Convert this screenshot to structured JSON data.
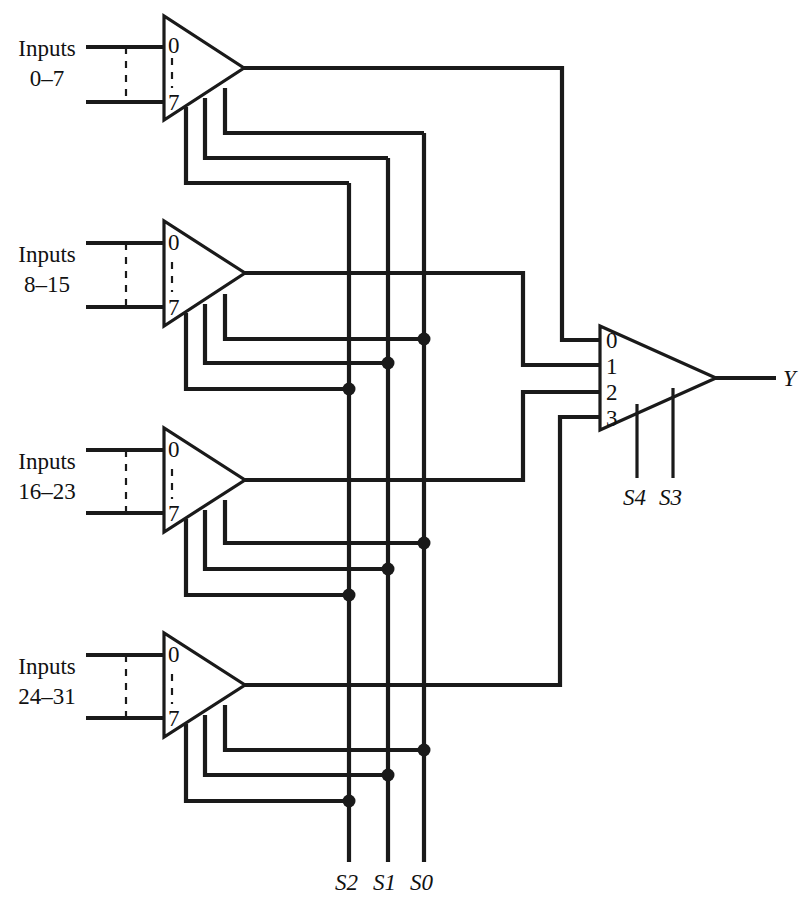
{
  "figure": {
    "ink_color": "#1a1a1a",
    "background": "#ffffff"
  },
  "input_groups": [
    {
      "id": "g1",
      "line1": "Inputs",
      "line2": "0–7"
    },
    {
      "id": "g2",
      "line1": "Inputs",
      "line2": "8–15"
    },
    {
      "id": "g3",
      "line1": "Inputs",
      "line2": "16–23"
    },
    {
      "id": "g4",
      "line1": "Inputs",
      "line2": "24–31"
    }
  ],
  "muxes": [
    {
      "id": "mux1",
      "kind": "8-to-1",
      "top_port": "0",
      "bottom_port": "7",
      "feeds_output_port": "0"
    },
    {
      "id": "mux2",
      "kind": "8-to-1",
      "top_port": "0",
      "bottom_port": "7",
      "feeds_output_port": "1"
    },
    {
      "id": "mux3",
      "kind": "8-to-1",
      "top_port": "0",
      "bottom_port": "7",
      "feeds_output_port": "2"
    },
    {
      "id": "mux4",
      "kind": "8-to-1",
      "top_port": "0",
      "bottom_port": "7",
      "feeds_output_port": "3"
    }
  ],
  "output_mux": {
    "id": "mux-out",
    "kind": "4-to-1",
    "ports": [
      "0",
      "1",
      "2",
      "3"
    ],
    "select_labels": [
      "S4",
      "S3"
    ],
    "output_label": "Y"
  },
  "select_bus": {
    "labels": [
      "S2",
      "S1",
      "S0"
    ]
  }
}
